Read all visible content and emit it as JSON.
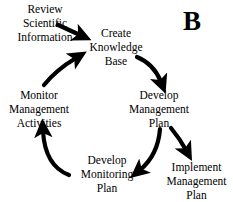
{
  "figure": {
    "panel_label": "B",
    "background_color": "#ffffff",
    "stroke_color": "#000000"
  },
  "nodes": [
    {
      "id": "review-scientific-information",
      "lines": [
        "Review",
        "Scientific",
        "Information"
      ]
    },
    {
      "id": "create-knowledge-base",
      "lines": [
        "Create",
        "Knowledge",
        "Base"
      ]
    },
    {
      "id": "develop-management-plan",
      "lines": [
        "Develop",
        "Management",
        "Plan"
      ]
    },
    {
      "id": "implement-management-plan",
      "lines": [
        "Implement",
        "Management",
        "Plan"
      ]
    },
    {
      "id": "develop-monitoring-plan",
      "lines": [
        "Develop",
        "Monitoring",
        "Plan"
      ]
    },
    {
      "id": "monitor-management-activities",
      "lines": [
        "Monitor",
        "Management",
        "Activities"
      ]
    }
  ],
  "connections": [
    {
      "from": "review-scientific-information",
      "to": "create-knowledge-base",
      "style": "straight-arrow"
    },
    {
      "from": "create-knowledge-base",
      "to": "develop-management-plan",
      "style": "curved-arrow"
    },
    {
      "from": "develop-management-plan",
      "to": "implement-management-plan",
      "style": "curved-arrow"
    },
    {
      "from": "develop-management-plan",
      "to": "develop-monitoring-plan",
      "style": "curved-arrow"
    },
    {
      "from": "develop-monitoring-plan",
      "to": "monitor-management-activities",
      "style": "curved-arrow"
    },
    {
      "from": "monitor-management-activities",
      "to": "create-knowledge-base",
      "style": "curved-arrow"
    }
  ]
}
